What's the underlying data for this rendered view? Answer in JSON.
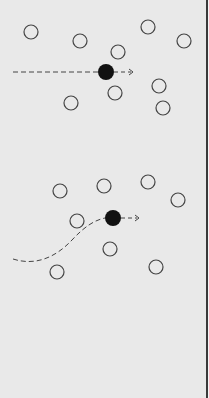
{
  "colors": {
    "background": "#e9e9e9",
    "stroke": "#444444",
    "agent_fill": "#111111",
    "edge": "#3a3a3a"
  },
  "panels": [
    {
      "name": "straight-path-panel",
      "agent": {
        "cx": 106,
        "cy": 72,
        "r": 8
      },
      "path_type": "straight",
      "path_d": "M 13 72 L 98 72",
      "heading_d": "M 114 72 L 131 72",
      "arrow_tip": {
        "x": 133,
        "y": 72
      },
      "obstacles": [
        {
          "cx": 31,
          "cy": 32
        },
        {
          "cx": 80,
          "cy": 41
        },
        {
          "cx": 148,
          "cy": 27
        },
        {
          "cx": 184,
          "cy": 41
        },
        {
          "cx": 118,
          "cy": 52
        },
        {
          "cx": 115,
          "cy": 93
        },
        {
          "cx": 159,
          "cy": 86
        },
        {
          "cx": 71,
          "cy": 103
        },
        {
          "cx": 163,
          "cy": 108
        }
      ]
    },
    {
      "name": "curved-path-panel",
      "agent": {
        "cx": 113,
        "cy": 218,
        "r": 8
      },
      "path_type": "curved",
      "path_d": "M 13 259 C 35 266, 55 258, 72 240 C 85 226, 95 220, 105 218",
      "heading_d": "M 121 218 L 137 218",
      "arrow_tip": {
        "x": 139,
        "y": 218
      },
      "obstacles": [
        {
          "cx": 60,
          "cy": 191
        },
        {
          "cx": 104,
          "cy": 186
        },
        {
          "cx": 148,
          "cy": 182
        },
        {
          "cx": 178,
          "cy": 200
        },
        {
          "cx": 77,
          "cy": 221
        },
        {
          "cx": 110,
          "cy": 249
        },
        {
          "cx": 57,
          "cy": 272
        },
        {
          "cx": 156,
          "cy": 267
        }
      ]
    }
  ],
  "obstacle_radius": 7
}
